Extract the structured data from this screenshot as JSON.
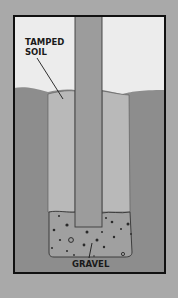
{
  "diagram": {
    "labels": {
      "tamped_soil_line1": "TAMPED",
      "tamped_soil_line2": "SOIL",
      "gravel": "GRAVEL"
    },
    "colors": {
      "page_background": "#a9a9a9",
      "frame_border": "#111111",
      "sky": "#ececec",
      "ground": "#8d8d8d",
      "tamped_soil": "#b9b9b9",
      "post": "#9c9c9c",
      "gravel": "#a0a0a0",
      "gravel_dots": "#2a2a2a",
      "outline": "#333333"
    },
    "components": [
      "frame",
      "sky",
      "ground",
      "hole",
      "tamped-soil",
      "post",
      "gravel-base",
      "tamped-soil-label",
      "gravel-label"
    ]
  }
}
